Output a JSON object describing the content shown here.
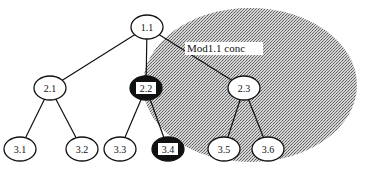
{
  "diagram": {
    "type": "tree",
    "region": {
      "label": "Mod1.1 conc",
      "fill": "#b8b8b8",
      "cx": 250,
      "cy": 85,
      "rx": 107,
      "ry": 77,
      "label_x": 187,
      "label_y": 52
    },
    "nodes": [
      {
        "id": "1.1",
        "label": "1.1",
        "x": 147,
        "y": 27,
        "style": "normal"
      },
      {
        "id": "2.1",
        "label": "2.1",
        "x": 50,
        "y": 88,
        "style": "normal"
      },
      {
        "id": "2.2",
        "label": "2.2",
        "x": 146,
        "y": 88,
        "style": "dark"
      },
      {
        "id": "2.3",
        "label": "2.3",
        "x": 244,
        "y": 88,
        "style": "normal"
      },
      {
        "id": "3.1",
        "label": "3.1",
        "x": 20,
        "y": 149,
        "style": "normal"
      },
      {
        "id": "3.2",
        "label": "3.2",
        "x": 82,
        "y": 149,
        "style": "normal"
      },
      {
        "id": "3.3",
        "label": "3.3",
        "x": 120,
        "y": 149,
        "style": "normal"
      },
      {
        "id": "3.4",
        "label": "3.4",
        "x": 168,
        "y": 149,
        "style": "dark"
      },
      {
        "id": "3.5",
        "label": "3.5",
        "x": 224,
        "y": 149,
        "style": "normal"
      },
      {
        "id": "3.6",
        "label": "3.6",
        "x": 268,
        "y": 149,
        "style": "normal"
      }
    ],
    "edges": [
      [
        "1.1",
        "2.1"
      ],
      [
        "1.1",
        "2.2"
      ],
      [
        "1.1",
        "2.3"
      ],
      [
        "2.1",
        "3.1"
      ],
      [
        "2.1",
        "3.2"
      ],
      [
        "2.2",
        "3.3"
      ],
      [
        "2.2",
        "3.4"
      ],
      [
        "2.3",
        "3.5"
      ],
      [
        "2.3",
        "3.6"
      ]
    ],
    "colors": {
      "line": "#111111",
      "node_fill": "#ffffff",
      "dark_fill": "#111111",
      "dark_label_bg": "#ffffff"
    }
  }
}
